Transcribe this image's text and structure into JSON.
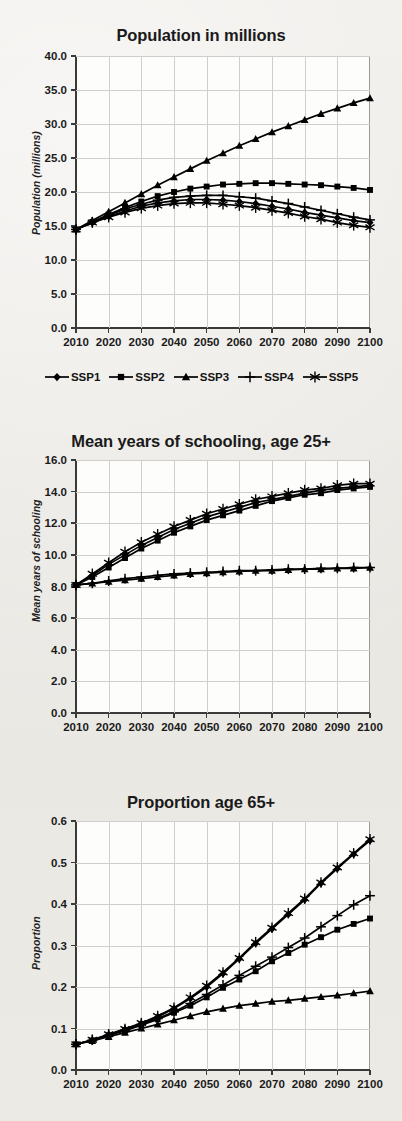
{
  "figure": {
    "x_tick_labels": [
      "2010",
      "2020",
      "2030",
      "2040",
      "2050",
      "2060",
      "2070",
      "2080",
      "2090",
      "2100"
    ],
    "legend": {
      "items": [
        {
          "label": "SSP1",
          "marker": "diamond"
        },
        {
          "label": "SSP2",
          "marker": "square"
        },
        {
          "label": "SSP3",
          "marker": "triangle"
        },
        {
          "label": "SSP4",
          "marker": "plus"
        },
        {
          "label": "SSP5",
          "marker": "asterisk"
        }
      ]
    },
    "line_color": "#000000"
  },
  "chart_data": [
    {
      "type": "line",
      "title": "Population in millions",
      "xlabel": "",
      "ylabel": "Population (millions)",
      "x": [
        2010,
        2015,
        2020,
        2025,
        2030,
        2035,
        2040,
        2045,
        2050,
        2055,
        2060,
        2065,
        2070,
        2075,
        2080,
        2085,
        2090,
        2095,
        2100
      ],
      "xlim": [
        2010,
        2100
      ],
      "ylim": [
        0.0,
        40.0
      ],
      "ytick_labels": [
        "0.0",
        "5.0",
        "10.0",
        "15.0",
        "20.0",
        "25.0",
        "30.0",
        "35.0",
        "40.0"
      ],
      "ytick_values": [
        0.0,
        5.0,
        10.0,
        15.0,
        20.0,
        25.0,
        30.0,
        35.0,
        40.0
      ],
      "grid": true,
      "series": [
        {
          "name": "SSP1",
          "marker": "diamond",
          "values": [
            14.5,
            15.5,
            16.4,
            17.2,
            17.9,
            18.4,
            18.7,
            18.9,
            18.9,
            18.8,
            18.6,
            18.3,
            17.9,
            17.5,
            17.0,
            16.6,
            16.2,
            15.8,
            15.5
          ]
        },
        {
          "name": "SSP2",
          "marker": "square",
          "values": [
            14.5,
            15.6,
            16.7,
            17.7,
            18.6,
            19.4,
            20.0,
            20.5,
            20.8,
            21.1,
            21.2,
            21.3,
            21.3,
            21.2,
            21.1,
            21.0,
            20.8,
            20.6,
            20.3
          ]
        },
        {
          "name": "SSP3",
          "marker": "triangle",
          "values": [
            14.5,
            15.8,
            17.1,
            18.4,
            19.7,
            21.0,
            22.2,
            23.4,
            24.6,
            25.7,
            26.8,
            27.8,
            28.8,
            29.7,
            30.6,
            31.5,
            32.3,
            33.1,
            33.8
          ]
        },
        {
          "name": "SSP4",
          "marker": "plus",
          "values": [
            14.5,
            15.6,
            16.6,
            17.5,
            18.2,
            18.8,
            19.2,
            19.4,
            19.5,
            19.5,
            19.3,
            19.1,
            18.7,
            18.3,
            17.8,
            17.3,
            16.8,
            16.3,
            15.9
          ]
        },
        {
          "name": "SSP5",
          "marker": "asterisk",
          "values": [
            14.5,
            15.5,
            16.3,
            17.0,
            17.6,
            18.0,
            18.3,
            18.4,
            18.4,
            18.2,
            18.0,
            17.7,
            17.3,
            16.9,
            16.4,
            16.0,
            15.5,
            15.1,
            14.8
          ]
        }
      ]
    },
    {
      "type": "line",
      "title": "Mean years of schooling, age 25+",
      "xlabel": "",
      "ylabel": "Mean years of schooling",
      "x": [
        2010,
        2015,
        2020,
        2025,
        2030,
        2035,
        2040,
        2045,
        2050,
        2055,
        2060,
        2065,
        2070,
        2075,
        2080,
        2085,
        2090,
        2095,
        2100
      ],
      "xlim": [
        2010,
        2100
      ],
      "ylim": [
        0.0,
        16.0
      ],
      "ytick_labels": [
        "0.0",
        "2.0",
        "4.0",
        "6.0",
        "8.0",
        "10.0",
        "12.0",
        "14.0",
        "16.0"
      ],
      "ytick_values": [
        0.0,
        2.0,
        4.0,
        6.0,
        8.0,
        10.0,
        12.0,
        14.0,
        16.0
      ],
      "grid": true,
      "series": [
        {
          "name": "SSP1",
          "marker": "diamond",
          "values": [
            8.1,
            8.7,
            9.4,
            10.0,
            10.6,
            11.1,
            11.6,
            12.0,
            12.4,
            12.7,
            13.0,
            13.3,
            13.5,
            13.7,
            13.9,
            14.1,
            14.2,
            14.3,
            14.4
          ]
        },
        {
          "name": "SSP2",
          "marker": "square",
          "values": [
            8.1,
            8.6,
            9.2,
            9.8,
            10.4,
            10.9,
            11.4,
            11.8,
            12.2,
            12.5,
            12.8,
            13.1,
            13.4,
            13.6,
            13.8,
            13.9,
            14.1,
            14.2,
            14.3
          ]
        },
        {
          "name": "SSP3",
          "marker": "triangle",
          "values": [
            8.1,
            8.2,
            8.3,
            8.4,
            8.5,
            8.6,
            8.7,
            8.8,
            8.85,
            8.9,
            8.95,
            9.0,
            9.0,
            9.05,
            9.1,
            9.1,
            9.15,
            9.15,
            9.2
          ]
        },
        {
          "name": "SSP4",
          "marker": "plus",
          "values": [
            8.1,
            8.2,
            8.35,
            8.5,
            8.6,
            8.7,
            8.8,
            8.85,
            8.9,
            8.95,
            9.0,
            9.0,
            9.05,
            9.1,
            9.1,
            9.15,
            9.15,
            9.2,
            9.2
          ]
        },
        {
          "name": "SSP5",
          "marker": "asterisk",
          "values": [
            8.1,
            8.8,
            9.5,
            10.2,
            10.8,
            11.3,
            11.8,
            12.2,
            12.6,
            12.9,
            13.2,
            13.5,
            13.7,
            13.9,
            14.1,
            14.2,
            14.4,
            14.5,
            14.5
          ]
        }
      ]
    },
    {
      "type": "line",
      "title": "Proportion age 65+",
      "xlabel": "",
      "ylabel": "Proportion",
      "x": [
        2010,
        2015,
        2020,
        2025,
        2030,
        2035,
        2040,
        2045,
        2050,
        2055,
        2060,
        2065,
        2070,
        2075,
        2080,
        2085,
        2090,
        2095,
        2100
      ],
      "xlim": [
        2010,
        2100
      ],
      "ylim": [
        0.0,
        0.6
      ],
      "ytick_labels": [
        "0.0",
        "0.1",
        "0.2",
        "0.3",
        "0.4",
        "0.5",
        "0.6"
      ],
      "ytick_values": [
        0.0,
        0.1,
        0.2,
        0.3,
        0.4,
        0.5,
        0.6
      ],
      "grid": true,
      "series": [
        {
          "name": "SSP1",
          "marker": "diamond",
          "values": [
            0.062,
            0.072,
            0.085,
            0.098,
            0.112,
            0.128,
            0.148,
            0.172,
            0.2,
            0.232,
            0.268,
            0.305,
            0.34,
            0.375,
            0.41,
            0.45,
            0.485,
            0.52,
            0.553
          ]
        },
        {
          "name": "SSP2",
          "marker": "square",
          "values": [
            0.062,
            0.071,
            0.083,
            0.095,
            0.108,
            0.122,
            0.138,
            0.155,
            0.175,
            0.198,
            0.218,
            0.238,
            0.262,
            0.282,
            0.302,
            0.32,
            0.338,
            0.352,
            0.365
          ]
        },
        {
          "name": "SSP3",
          "marker": "triangle",
          "values": [
            0.062,
            0.07,
            0.08,
            0.09,
            0.1,
            0.11,
            0.12,
            0.13,
            0.14,
            0.148,
            0.155,
            0.16,
            0.165,
            0.168,
            0.172,
            0.176,
            0.18,
            0.185,
            0.19
          ]
        },
        {
          "name": "SSP4",
          "marker": "plus",
          "values": [
            0.062,
            0.072,
            0.084,
            0.096,
            0.11,
            0.124,
            0.14,
            0.16,
            0.182,
            0.205,
            0.228,
            0.25,
            0.272,
            0.295,
            0.318,
            0.345,
            0.372,
            0.398,
            0.42
          ]
        },
        {
          "name": "SSP5",
          "marker": "asterisk",
          "values": [
            0.062,
            0.073,
            0.086,
            0.099,
            0.113,
            0.13,
            0.15,
            0.175,
            0.203,
            0.235,
            0.27,
            0.308,
            0.343,
            0.378,
            0.413,
            0.452,
            0.488,
            0.522,
            0.556
          ]
        }
      ]
    }
  ]
}
